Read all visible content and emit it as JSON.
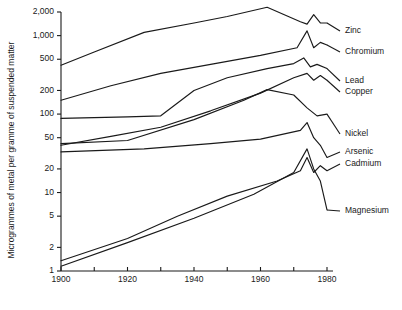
{
  "chart_data": {
    "type": "line",
    "title": "",
    "xlabel": "",
    "ylabel": "Microgrammes of metal per gramme of suspended matter",
    "xlim": [
      1900,
      1980
    ],
    "ylim": [
      1,
      2000
    ],
    "yscale": "log",
    "xscale": "linear",
    "grid": false,
    "legend_position": "right-inline-labels",
    "xticks": [
      1900,
      1910,
      1920,
      1930,
      1940,
      1950,
      1960,
      1970,
      1980
    ],
    "xtick_labels": [
      "1900",
      "",
      "1920",
      "",
      "1940",
      "",
      "1960",
      "",
      "1980"
    ],
    "yticks": [
      1,
      2,
      5,
      10,
      20,
      50,
      100,
      200,
      500,
      1000,
      2000
    ],
    "ytick_labels": [
      "1",
      "2",
      "5",
      "10",
      "20",
      "50",
      "100",
      "200",
      "500",
      "1,000",
      "2,000"
    ],
    "series": [
      {
        "name": "Zinc",
        "label": "Zinc",
        "x": [
          1900,
          1910,
          1925,
          1940,
          1950,
          1962,
          1972,
          1974,
          1976,
          1978,
          1980
        ],
        "values": [
          420,
          620,
          1100,
          1450,
          1750,
          2300,
          1500,
          1400,
          1850,
          1450,
          1450
        ]
      },
      {
        "name": "Chromium",
        "label": "Chromium",
        "x": [
          1900,
          1915,
          1930,
          1945,
          1960,
          1971,
          1974,
          1976,
          1978,
          1980
        ],
        "values": [
          150,
          230,
          330,
          430,
          560,
          700,
          1150,
          700,
          820,
          760
        ]
      },
      {
        "name": "Lead",
        "label": "Lead",
        "x": [
          1900,
          1920,
          1930,
          1940,
          1950,
          1962,
          1970,
          1973,
          1975,
          1977,
          1980
        ],
        "values": [
          88,
          92,
          95,
          200,
          290,
          380,
          440,
          520,
          400,
          430,
          380
        ]
      },
      {
        "name": "Copper",
        "label": "Copper",
        "x": [
          1900,
          1915,
          1930,
          1945,
          1960,
          1970,
          1974,
          1976,
          1978,
          1980
        ],
        "values": [
          40,
          52,
          68,
          110,
          185,
          290,
          330,
          270,
          310,
          270
        ]
      },
      {
        "name": "Nickel",
        "label": "Nickel",
        "x": [
          1900,
          1920,
          1940,
          1955,
          1962,
          1970,
          1974,
          1977,
          1980
        ],
        "values": [
          42,
          46,
          85,
          150,
          205,
          175,
          120,
          95,
          100
        ]
      },
      {
        "name": "Arsenic",
        "label": "Arsenic",
        "x": [
          1900,
          1925,
          1945,
          1960,
          1972,
          1974,
          1976,
          1978,
          1980
        ],
        "values": [
          33,
          36,
          42,
          48,
          62,
          78,
          50,
          40,
          28
        ]
      },
      {
        "name": "Cadmium",
        "label": "Cadmium",
        "x": [
          1900,
          1920,
          1935,
          1950,
          1965,
          1972,
          1974,
          1976,
          1978,
          1980
        ],
        "values": [
          1.35,
          2.6,
          5.0,
          9.0,
          14,
          19,
          28,
          18,
          22,
          19
        ]
      },
      {
        "name": "Magnesium",
        "label": "Magnesium",
        "x": [
          1900,
          1920,
          1940,
          1958,
          1970,
          1974,
          1976,
          1978,
          1980
        ],
        "values": [
          1.15,
          2.3,
          4.7,
          9.5,
          18,
          36,
          20,
          14,
          6.0
        ]
      }
    ],
    "series_label_positions": [
      {
        "name": "Zinc",
        "label": "Zinc",
        "x": 345,
        "y": 31
      },
      {
        "name": "Chromium",
        "label": "Chromium",
        "x": 345,
        "y": 52
      },
      {
        "name": "Lead",
        "label": "Lead",
        "x": 345,
        "y": 81
      },
      {
        "name": "Copper",
        "label": "Copper",
        "x": 345,
        "y": 92
      },
      {
        "name": "Nickel",
        "label": "Nickel",
        "x": 345,
        "y": 134
      },
      {
        "name": "Arsenic",
        "label": "Arsenic",
        "x": 345,
        "y": 152
      },
      {
        "name": "Cadmium",
        "label": "Cadmium",
        "x": 345,
        "y": 164
      },
      {
        "name": "Magnesium",
        "label": "Magnesium",
        "x": 345,
        "y": 211
      }
    ]
  },
  "geometry": {
    "plot_left": 61,
    "plot_right": 327,
    "plot_top": 12,
    "plot_bottom": 271,
    "axis_title_x": 14,
    "axis_title_y": 150
  },
  "colors": {
    "background": "#ffffff",
    "ink": "#1a1a1a"
  }
}
